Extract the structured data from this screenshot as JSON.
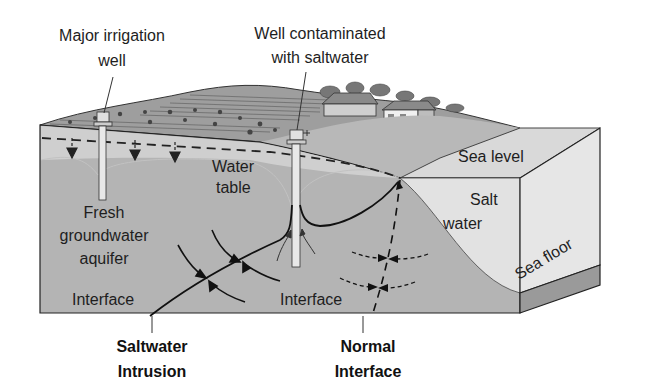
{
  "diagram": {
    "labels": {
      "irrigation_well_line1": "Major irrigation",
      "irrigation_well_line2": "well",
      "contaminated_well_line1": "Well contaminated",
      "contaminated_well_line2": "with saltwater",
      "sea_level": "Sea level",
      "salt_water_line1": "Salt",
      "salt_water_line2": "water",
      "sea_floor": "Sea floor",
      "water_table_line1": "Water",
      "water_table_line2": "table",
      "aquifer_line1": "Fresh",
      "aquifer_line2": "groundwater",
      "aquifer_line3": "aquifer",
      "interface_left": "Interface",
      "interface_right": "Interface",
      "saltwater_intrusion_line1": "Saltwater",
      "saltwater_intrusion_line2": "Intrusion",
      "normal_interface_line1": "Normal",
      "normal_interface_line2": "Interface"
    },
    "colors": {
      "aquifer": "#b4b4b4",
      "unsaturated_zone": "#cfcfcf",
      "salt_water": "#e2e2e2",
      "sea_surface": "#d9d9d9",
      "sea_floor": "#9a9a9a",
      "land_surface": "#a8a8a8",
      "outline": "#222222"
    }
  }
}
